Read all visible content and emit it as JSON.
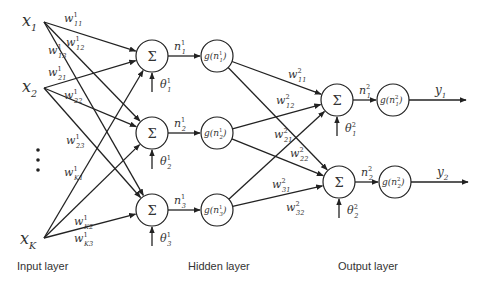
{
  "layers": {
    "input": {
      "label": "Input layer",
      "nodes": [
        {
          "id": "x1",
          "label": "x",
          "sub": "1"
        },
        {
          "id": "x2",
          "label": "x",
          "sub": "2"
        },
        {
          "id": "xK",
          "label": "x",
          "sub": "K"
        }
      ],
      "ellipsis": "⋮"
    },
    "hidden": {
      "label": "Hidden layer",
      "sum_nodes": [
        {
          "id": "h1",
          "symbol": "Σ",
          "net": "n",
          "net_sup": "1",
          "net_sub": "1",
          "bias": "θ",
          "bias_sup": "1",
          "bias_sub": "1"
        },
        {
          "id": "h2",
          "symbol": "Σ",
          "net": "n",
          "net_sup": "1",
          "net_sub": "2",
          "bias": "θ",
          "bias_sup": "1",
          "bias_sub": "2"
        },
        {
          "id": "h3",
          "symbol": "Σ",
          "net": "n",
          "net_sup": "1",
          "net_sub": "3",
          "bias": "θ",
          "bias_sup": "1",
          "bias_sub": "3"
        }
      ],
      "activation_nodes": [
        {
          "id": "g1",
          "text": "g(n",
          "sup": "1",
          "sub": "1",
          "close": ")"
        },
        {
          "id": "g2",
          "text": "g(n",
          "sup": "1",
          "sub": "2",
          "close": ")"
        },
        {
          "id": "g3",
          "text": "g(n",
          "sup": "1",
          "sub": "3",
          "close": ")"
        }
      ]
    },
    "output": {
      "label": "Output layer",
      "sum_nodes": [
        {
          "id": "o1",
          "symbol": "Σ",
          "net": "n",
          "net_sup": "2",
          "net_sub": "1",
          "bias": "θ",
          "bias_sup": "2",
          "bias_sub": "1"
        },
        {
          "id": "o2",
          "symbol": "Σ",
          "net": "n",
          "net_sup": "2",
          "net_sub": "2",
          "bias": "θ",
          "bias_sup": "2",
          "bias_sub": "2"
        }
      ],
      "activation_nodes": [
        {
          "id": "go1",
          "text": "g(n",
          "sup": "2",
          "sub": "1",
          "close": ")"
        },
        {
          "id": "go2",
          "text": "g(n",
          "sup": "2",
          "sub": "2",
          "close": ")"
        }
      ],
      "outputs": [
        {
          "id": "y1",
          "label": "y",
          "sub": "1"
        },
        {
          "id": "y2",
          "label": "y",
          "sub": "2"
        }
      ]
    }
  },
  "weights_layer1": [
    {
      "from": "x1",
      "to": "h1",
      "w": "w",
      "sup": "1",
      "sub": "11"
    },
    {
      "from": "x1",
      "to": "h2",
      "w": "w",
      "sup": "1",
      "sub": "12"
    },
    {
      "from": "x1",
      "to": "h3",
      "w": "w",
      "sup": "1",
      "sub": "13"
    },
    {
      "from": "x2",
      "to": "h1",
      "w": "w",
      "sup": "1",
      "sub": "21"
    },
    {
      "from": "x2",
      "to": "h2",
      "w": "w",
      "sup": "1",
      "sub": "22"
    },
    {
      "from": "x2",
      "to": "h3",
      "w": "w",
      "sup": "1",
      "sub": "23"
    },
    {
      "from": "xK",
      "to": "h1",
      "w": "w",
      "sup": "1",
      "sub": "K1"
    },
    {
      "from": "xK",
      "to": "h2",
      "w": "w",
      "sup": "1",
      "sub": "K2"
    },
    {
      "from": "xK",
      "to": "h3",
      "w": "w",
      "sup": "1",
      "sub": "K3"
    }
  ],
  "weights_layer2": [
    {
      "from": "g1",
      "to": "o1",
      "w": "w",
      "sup": "2",
      "sub": "11"
    },
    {
      "from": "g1",
      "to": "o2",
      "w": "w",
      "sup": "2",
      "sub": "12"
    },
    {
      "from": "g2",
      "to": "o1",
      "w": "w",
      "sup": "2",
      "sub": "21"
    },
    {
      "from": "g2",
      "to": "o2",
      "w": "w",
      "sup": "2",
      "sub": "22"
    },
    {
      "from": "g3",
      "to": "o1",
      "w": "w",
      "sup": "2",
      "sub": "31"
    },
    {
      "from": "g3",
      "to": "o2",
      "w": "w",
      "sup": "2",
      "sub": "32"
    }
  ]
}
